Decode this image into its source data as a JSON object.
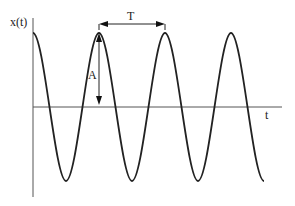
{
  "diagram": {
    "y_axis_label": "x(t)",
    "x_axis_label": "t",
    "period_label": "T",
    "amplitude_label": "A",
    "cycles_shown": 3.5,
    "colors": {
      "line": "#222222",
      "axis": "#444444",
      "background": "#ffffff"
    }
  }
}
